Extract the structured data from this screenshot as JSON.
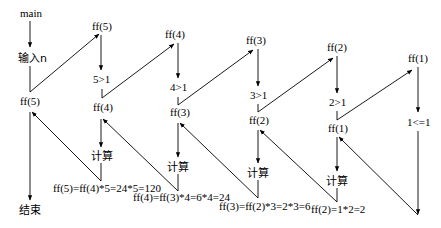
{
  "diagram": {
    "labels": {
      "main": "main",
      "input": "输入n",
      "end": "结束",
      "ff5_main": "ff(5)",
      "ff5": "ff(5)",
      "cond5": "5>1",
      "ff4_call": "ff(4)",
      "ff4": "ff(4)",
      "cond4": "4>1",
      "ff3_call": "ff(3)",
      "ff3": "ff(3)",
      "cond3": "3>1",
      "ff2_call": "ff(2)",
      "ff2": "ff(2)",
      "cond2": "2>1",
      "ff1_call": "ff(1)",
      "ff1": "ff(1)",
      "cond1": "1<=1",
      "calc1": "计算",
      "calc2": "计算",
      "calc3": "计算",
      "calc4": "计算",
      "ret5": "ff(5)=ff(4)*5=24*5=120",
      "ret4": "ff(4)=ff(3)*4=6*4=24",
      "ret3": "ff(3)=ff(2)*3=2*3=6",
      "ret2": "ff(2)=1*2=2"
    }
  }
}
